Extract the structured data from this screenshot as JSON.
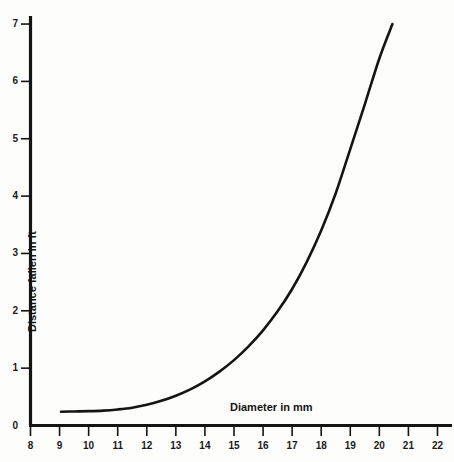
{
  "chart_data": {
    "type": "line",
    "title": "",
    "subtitle": "",
    "xlabel": "Diameter in mm",
    "ylabel": "Distance fallen in ft",
    "xlim": [
      8,
      22.3
    ],
    "ylim": [
      0,
      7.1
    ],
    "grid": false,
    "legend": null,
    "xticks": [
      8,
      9,
      10,
      11,
      12,
      13,
      14,
      15,
      16,
      17,
      18,
      19,
      20,
      21,
      22
    ],
    "xtick_labels": [
      "8",
      "9",
      "10",
      "11",
      "12",
      "13",
      "14",
      "15",
      "16",
      "17",
      "18",
      "19",
      "20",
      "21",
      "22"
    ],
    "yticks": [
      0,
      1,
      2,
      3,
      4,
      5,
      6,
      7
    ],
    "ytick_labels": [
      "0",
      "1",
      "2",
      "3",
      "4",
      "5",
      "6",
      "7"
    ],
    "series": [
      {
        "name": "Distance fallen vs diameter",
        "color": "#141414",
        "line_width": 2.6,
        "x": [
          9.05,
          9.5,
          10.0,
          10.5,
          11.0,
          11.5,
          12.0,
          12.5,
          13.0,
          13.5,
          14.0,
          14.5,
          15.0,
          15.5,
          16.0,
          16.5,
          17.0,
          17.5,
          18.0,
          18.5,
          19.0,
          19.5,
          20.0,
          20.45
        ],
        "y": [
          0.24,
          0.245,
          0.25,
          0.26,
          0.28,
          0.31,
          0.36,
          0.43,
          0.52,
          0.63,
          0.77,
          0.94,
          1.14,
          1.38,
          1.66,
          1.99,
          2.38,
          2.85,
          3.4,
          4.05,
          4.82,
          5.6,
          6.4,
          7.0
        ]
      }
    ],
    "annotations": []
  },
  "axes": {
    "x_axis_label": "Diameter in mm",
    "y_axis_label": "Distance fallen in ft",
    "axis_color": "#141414",
    "tick_color": "#1a1a1a"
  },
  "figure": {
    "background_color": "#fdfdfb",
    "width": 454,
    "height": 462
  }
}
